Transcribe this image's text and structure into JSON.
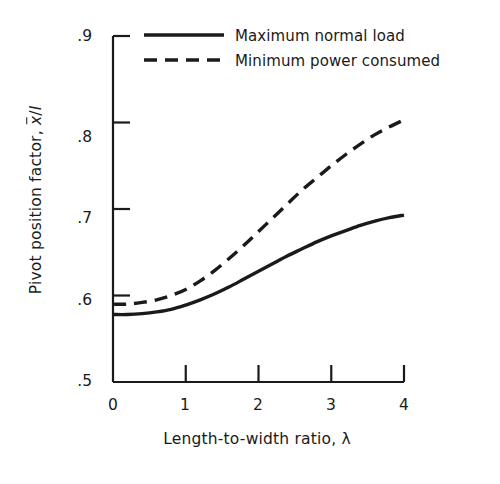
{
  "chart_data": {
    "type": "line",
    "title": "",
    "xlabel": "Length-to-width ratio, λ",
    "ylabel_prefix": "Pivot position factor, ",
    "ylabel_symbol_x": "x",
    "ylabel_symbol_sep": "/",
    "ylabel_symbol_l": "l",
    "ylabel": "Pivot position factor, x̄/l",
    "xlim": [
      0,
      4
    ],
    "ylim": [
      0.5,
      0.9
    ],
    "xticks": [
      0,
      1,
      2,
      3,
      4
    ],
    "xtick_labels": [
      "0",
      "1",
      "2",
      "3",
      "4"
    ],
    "yticks": [
      0.5,
      0.6,
      0.7,
      0.8,
      0.9
    ],
    "ytick_labels": [
      ".5",
      ".6",
      ".7",
      ".8",
      ".9"
    ],
    "grid": false,
    "legend_position": "upper-center",
    "series": [
      {
        "name": "Maximum normal load",
        "style": "solid",
        "color": "#1a1a1a",
        "x": [
          0,
          0.2,
          0.4,
          0.6,
          0.8,
          1.0,
          1.2,
          1.4,
          1.6,
          1.8,
          2.0,
          2.2,
          2.4,
          2.6,
          2.8,
          3.0,
          3.2,
          3.4,
          3.6,
          3.8,
          4.0
        ],
        "values": [
          0.578,
          0.578,
          0.579,
          0.581,
          0.584,
          0.589,
          0.595,
          0.602,
          0.61,
          0.619,
          0.628,
          0.637,
          0.646,
          0.654,
          0.662,
          0.669,
          0.675,
          0.681,
          0.686,
          0.69,
          0.693
        ]
      },
      {
        "name": "Minimum power consumed",
        "style": "dashed",
        "color": "#1a1a1a",
        "x": [
          0,
          0.2,
          0.4,
          0.6,
          0.8,
          1.0,
          1.2,
          1.4,
          1.6,
          1.8,
          2.0,
          2.2,
          2.4,
          2.6,
          2.8,
          3.0,
          3.2,
          3.4,
          3.6,
          3.8,
          4.0
        ],
        "values": [
          0.59,
          0.59,
          0.592,
          0.595,
          0.6,
          0.607,
          0.617,
          0.629,
          0.643,
          0.658,
          0.674,
          0.69,
          0.706,
          0.722,
          0.736,
          0.75,
          0.763,
          0.775,
          0.786,
          0.795,
          0.803
        ]
      }
    ]
  },
  "legend": {
    "entries": [
      {
        "label": "Maximum normal load",
        "style": "solid"
      },
      {
        "label": "Minimum power consumed",
        "style": "dashed"
      }
    ]
  }
}
